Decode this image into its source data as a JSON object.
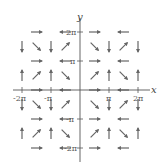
{
  "figure": {
    "type": "vector_field",
    "xlabel": "x",
    "ylabel": "y",
    "x_ticks": [
      "-2π",
      "-π",
      "π",
      "2π"
    ],
    "y_ticks": [
      "2π",
      "π",
      "-π",
      "-2π"
    ],
    "xlim": [
      "-2π",
      "2π"
    ],
    "ylim": [
      "-2π",
      "2π"
    ],
    "grid_step": "π/2",
    "arrow_color": "#666666",
    "axis_color": "#555555"
  },
  "arrows": {
    "description": "Grid of unit-length arrows at spacing π/2; directions indexed by row (y from 2π down to -2π) and column (x from -2π to 2π)",
    "rows": [
      {
        "y": "2π",
        "dirs": [
          "",
          "E",
          "",
          "W",
          "",
          "E",
          "",
          "W",
          ""
        ]
      },
      {
        "y": "3π/2",
        "dirs": [
          "S",
          "SE",
          "S",
          "NE",
          "",
          "SE",
          "S",
          "NE",
          "S"
        ]
      },
      {
        "y": "π",
        "dirs": [
          "",
          "E",
          "",
          "W",
          "",
          "E",
          "",
          "W",
          ""
        ]
      },
      {
        "y": "π/2",
        "dirs": [
          "N",
          "NE",
          "N",
          "SE",
          "",
          "NE",
          "N",
          "SE",
          "N"
        ]
      },
      {
        "y": "0",
        "dirs": [
          "",
          "E",
          "",
          "W",
          "",
          "E",
          "",
          "W",
          ""
        ]
      },
      {
        "y": "-π/2",
        "dirs": [
          "S",
          "SE",
          "S",
          "NE",
          "",
          "SE",
          "S",
          "NE",
          "S"
        ]
      },
      {
        "y": "-π",
        "dirs": [
          "",
          "E",
          "",
          "W",
          "",
          "E",
          "",
          "W",
          ""
        ]
      },
      {
        "y": "-3π/2",
        "dirs": [
          "N",
          "NE",
          "N",
          "SE",
          "",
          "NE",
          "N",
          "SE",
          "N"
        ]
      },
      {
        "y": "-2π",
        "dirs": [
          "",
          "E",
          "",
          "W",
          "",
          "E",
          "",
          "W",
          ""
        ]
      }
    ]
  }
}
